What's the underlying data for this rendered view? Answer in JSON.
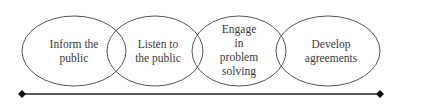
{
  "diagram": {
    "type": "overlapping-ellipses-continuum",
    "colors": {
      "stroke": "#555555",
      "text": "#3a3a3a",
      "axis": "#222222",
      "background": "#ffffff"
    },
    "stages": [
      {
        "label": "Inform the\npublic",
        "cx": 74,
        "cy": 51,
        "rx": 52,
        "ry": 35
      },
      {
        "label": "Listen to\nthe public",
        "cx": 155,
        "cy": 51,
        "rx": 48,
        "ry": 35
      },
      {
        "label": "Engage\nin\nproblem\nsolving",
        "cx": 239,
        "cy": 51,
        "rx": 47,
        "ry": 35
      },
      {
        "label": "Develop\nagreements",
        "cx": 328,
        "cy": 51,
        "rx": 52,
        "ry": 35
      }
    ],
    "axis": {
      "x1": 22,
      "x2": 380,
      "y": 94,
      "endpoints": "diamond"
    }
  }
}
